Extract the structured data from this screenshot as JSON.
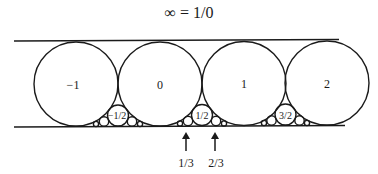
{
  "title": "∞ = 1/0",
  "diagram": {
    "type": "Ford circles",
    "lines": [
      "top",
      "bottom"
    ],
    "circles": [
      {
        "label": "−1",
        "p": -1,
        "q": 1
      },
      {
        "label": "0",
        "p": 0,
        "q": 1
      },
      {
        "label": "1",
        "p": 1,
        "q": 1
      },
      {
        "label": "2",
        "p": 2,
        "q": 1
      },
      {
        "label": "−1/2",
        "p": -1,
        "q": 2
      },
      {
        "label": "1/2",
        "p": 1,
        "q": 2
      },
      {
        "label": "3/2",
        "p": 3,
        "q": 2
      }
    ],
    "arrows": [
      {
        "label": "1/3"
      },
      {
        "label": "2/3"
      }
    ]
  }
}
